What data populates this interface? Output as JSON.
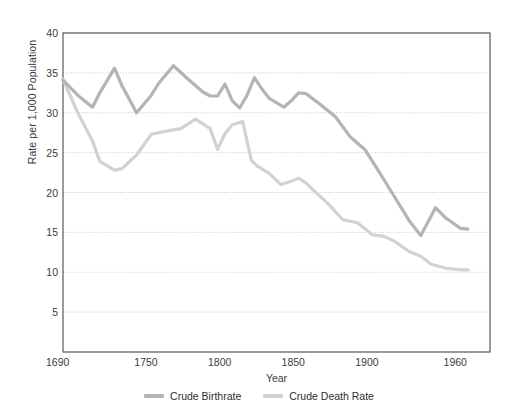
{
  "chart_data": {
    "type": "line",
    "title": "",
    "xlabel": "Year",
    "ylabel": "Rate per 1,000 Population",
    "xlim": [
      1690,
      1980
    ],
    "ylim": [
      0,
      40
    ],
    "grid": true,
    "legend_position": "bottom",
    "y_ticks": [
      5,
      10,
      15,
      20,
      25,
      30,
      35,
      40
    ],
    "x_ticks": [
      1690,
      1750,
      1800,
      1850,
      1900,
      1960
    ],
    "colors": {
      "crude_birthrate": "#b4b4b4",
      "crude_death_rate": "#d2d2d2",
      "axis": "#595959",
      "gridline": "#c8c8c8",
      "text": "#3b3b3b",
      "background": "#ffffff"
    },
    "series": [
      {
        "name": "Crude Birthrate",
        "color": "#b4b4b4",
        "x": [
          1690,
          1700,
          1710,
          1715,
          1725,
          1730,
          1740,
          1750,
          1755,
          1765,
          1775,
          1785,
          1790,
          1795,
          1800,
          1805,
          1810,
          1815,
          1820,
          1825,
          1830,
          1840,
          1845,
          1850,
          1855,
          1865,
          1875,
          1885,
          1895,
          1905,
          1915,
          1925,
          1933,
          1943,
          1950,
          1960,
          1965
        ],
        "values": [
          34.1,
          32.2,
          30.7,
          32.5,
          35.6,
          33.4,
          30.0,
          32.2,
          33.7,
          35.9,
          34.2,
          32.6,
          32.1,
          32.1,
          33.6,
          31.5,
          30.6,
          32.2,
          34.4,
          33.0,
          31.8,
          30.7,
          31.5,
          32.5,
          32.4,
          31.0,
          29.5,
          27.0,
          25.4,
          22.5,
          19.5,
          16.5,
          14.6,
          18.1,
          16.8,
          15.5,
          15.4
        ]
      },
      {
        "name": "Crude Death Rate",
        "color": "#d2d2d2",
        "x": [
          1690,
          1700,
          1710,
          1715,
          1725,
          1730,
          1740,
          1750,
          1760,
          1770,
          1780,
          1790,
          1795,
          1800,
          1805,
          1812,
          1818,
          1822,
          1830,
          1838,
          1845,
          1850,
          1855,
          1860,
          1870,
          1880,
          1890,
          1900,
          1908,
          1915,
          1925,
          1933,
          1940,
          1950,
          1960,
          1965
        ],
        "values": [
          34.2,
          30.0,
          26.5,
          23.9,
          22.8,
          23.0,
          24.7,
          27.3,
          27.7,
          28.0,
          29.2,
          28.0,
          25.4,
          27.4,
          28.5,
          28.9,
          24.0,
          23.3,
          22.4,
          21.0,
          21.4,
          21.8,
          21.2,
          20.3,
          18.6,
          16.6,
          16.2,
          14.7,
          14.5,
          13.9,
          12.6,
          12.0,
          11.0,
          10.5,
          10.3,
          10.3
        ]
      }
    ]
  },
  "legend": {
    "items": [
      {
        "label": "Crude Birthrate",
        "color": "#b4b4b4"
      },
      {
        "label": "Crude Death Rate",
        "color": "#d2d2d2"
      }
    ]
  }
}
